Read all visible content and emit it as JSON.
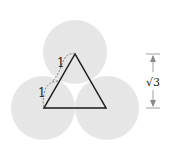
{
  "diagram": {
    "circles": [
      {
        "name": "top",
        "cx": 75,
        "cy": 52,
        "r": 32
      },
      {
        "name": "bottom-left",
        "cx": 43,
        "cy": 108,
        "r": 32
      },
      {
        "name": "bottom-right",
        "cx": 107,
        "cy": 108,
        "r": 32
      }
    ],
    "circle_color": "#e6e6e6",
    "triangle_color": "#1a1a1a",
    "labels": {
      "upper_side": "1",
      "lower_side": "1",
      "height": "√3"
    }
  }
}
